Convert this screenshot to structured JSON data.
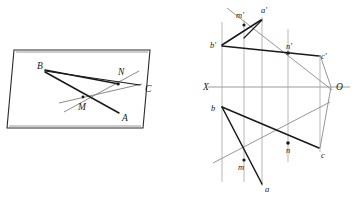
{
  "figure": {
    "colors": {
      "ink": "#1a1a1a",
      "thin_gray": "#8a8a8a",
      "axis_gray": "#9a9a9a",
      "background": "#ffffff"
    },
    "left_diagram": {
      "name": "spatial-plane-view",
      "plane": {
        "name": "parallelogram-plane",
        "vertices": [
          [
            14,
            50
          ],
          [
            150,
            50
          ],
          [
            143,
            128
          ],
          [
            7,
            128
          ]
        ]
      },
      "labels": [
        {
          "id": "B",
          "text": "B",
          "x": 40,
          "y": 67
        },
        {
          "id": "N",
          "text": "N",
          "x": 120,
          "y": 72
        },
        {
          "id": "C",
          "text": "C",
          "x": 145,
          "y": 89
        },
        {
          "id": "M",
          "text": "M",
          "x": 79,
          "y": 107
        },
        {
          "id": "A",
          "text": "A",
          "x": 122,
          "y": 119
        }
      ],
      "segments": [
        {
          "id": "B-to-N",
          "from": [
            46,
            71
          ],
          "to": [
            120,
            85
          ]
        },
        {
          "id": "B-to-A",
          "from": [
            46,
            72
          ],
          "to": [
            118,
            112
          ]
        },
        {
          "id": "line-MC-through",
          "from": [
            61,
            102
          ],
          "to": [
            140,
            84
          ]
        },
        {
          "id": "line-AN-through",
          "from": [
            65,
            110
          ],
          "to": [
            137,
            73
          ]
        }
      ],
      "points": [
        {
          "id": "N-point",
          "x": 118,
          "y": 84
        },
        {
          "id": "M-point",
          "x": 83,
          "y": 98
        }
      ]
    },
    "right_diagram": {
      "name": "orthographic-projection-view",
      "axis": {
        "label_left": "X",
        "label_right": "O",
        "label_left_pos": [
          203,
          90
        ],
        "label_right_pos": [
          337,
          90
        ],
        "line_from": [
          208,
          87
        ],
        "line_to": [
          350,
          87
        ]
      },
      "vertical_lines": [
        {
          "id": "vline-b",
          "x": 222,
          "y1": 22,
          "y2": 182
        },
        {
          "id": "vline-m",
          "x": 244,
          "y1": 20,
          "y2": 182
        },
        {
          "id": "vline-a",
          "x": 262,
          "y1": 17,
          "y2": 186
        },
        {
          "id": "vline-n",
          "x": 288,
          "y1": 29,
          "y2": 160
        },
        {
          "id": "vline-c",
          "x": 320,
          "y1": 55,
          "y2": 152
        }
      ],
      "upper_labels": [
        {
          "id": "m-prime",
          "text": "m'",
          "x": 236,
          "y": 18
        },
        {
          "id": "a-prime",
          "text": "a'",
          "x": 262,
          "y": 14
        },
        {
          "id": "b-prime",
          "text": "b'",
          "x": 211,
          "y": 47
        },
        {
          "id": "n-prime",
          "text": "n'",
          "x": 287,
          "y": 50
        },
        {
          "id": "c-prime",
          "text": "c'",
          "x": 320,
          "y": 59
        }
      ],
      "lower_labels": [
        {
          "id": "b",
          "text": "b",
          "x": 212,
          "y": 111
        },
        {
          "id": "n",
          "text": "n",
          "x": 287,
          "y": 152
        },
        {
          "id": "c",
          "text": "c",
          "x": 321,
          "y": 157
        },
        {
          "id": "m",
          "text": "m",
          "x": 240,
          "y": 170
        },
        {
          "id": "a",
          "text": "a",
          "x": 266,
          "y": 190
        }
      ],
      "upper_segments": [
        {
          "id": "bp-to-ap",
          "from": [
            222,
            44
          ],
          "to": [
            262,
            20
          ]
        },
        {
          "id": "bp-to-np-cp",
          "from": [
            222,
            45
          ],
          "to": [
            320,
            55
          ]
        },
        {
          "id": "mp-to-long",
          "from": [
            228,
            9
          ],
          "to": [
            330,
            80
          ]
        },
        {
          "id": "np-marker-line",
          "from": [
            288,
            52
          ],
          "to": [
            320,
            56
          ]
        }
      ],
      "lower_segments": [
        {
          "id": "b-to-c",
          "from": [
            222,
            107
          ],
          "to": [
            320,
            148
          ]
        },
        {
          "id": "b-to-a",
          "from": [
            222,
            107
          ],
          "to": [
            262,
            183
          ]
        },
        {
          "id": "m-to-c-line",
          "from": [
            214,
            162
          ],
          "to": [
            328,
            103
          ]
        }
      ],
      "frame_segments": [
        {
          "id": "cp-down-to-axis",
          "from": [
            320,
            55
          ],
          "to": [
            331,
            87
          ]
        },
        {
          "id": "axis-to-c",
          "from": [
            331,
            87
          ],
          "to": [
            320,
            148
          ]
        }
      ],
      "marked_points": [
        {
          "id": "mp-point",
          "x": 244,
          "y": 25
        },
        {
          "id": "np-point",
          "x": 288,
          "y": 53
        },
        {
          "id": "n-point",
          "x": 288,
          "y": 143
        },
        {
          "id": "m-point",
          "x": 244,
          "y": 160
        }
      ]
    }
  }
}
